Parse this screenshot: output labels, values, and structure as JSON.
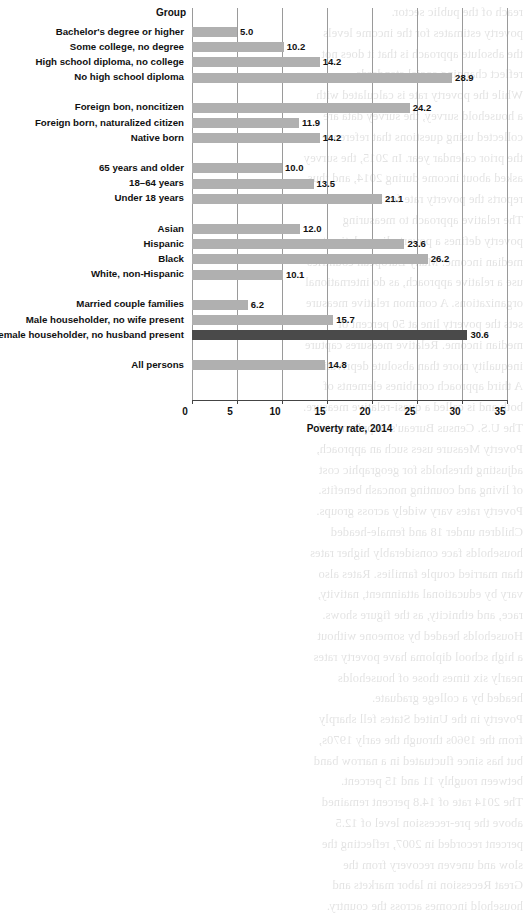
{
  "header": {
    "group_column_label": "Group"
  },
  "axis": {
    "x_title": "Poverty rate, 2014",
    "ticks": [
      "0",
      "5",
      "10",
      "15",
      "20",
      "25",
      "30",
      "35"
    ],
    "xmin": 0,
    "xmax": 35,
    "tick_step": 5
  },
  "colors": {
    "bar": "#b0b0b0",
    "bar_highlight": "#4a4a4a",
    "gridline": "#9a9a9a",
    "axis": "#444444",
    "text": "#111111",
    "background": "#ffffff"
  },
  "chart_data": {
    "type": "bar",
    "orientation": "horizontal",
    "title": "",
    "xlabel": "Poverty rate, 2014",
    "ylabel": "Group",
    "xlim": [
      0,
      35
    ],
    "grid": true,
    "legend": false,
    "categories": [
      "Bachelor's degree or higher",
      "Some college, no degree",
      "High school diploma, no college",
      "No high school diploma",
      "Foreign bon, noncitizen",
      "Foreign born, naturalized citizen",
      "Native born",
      "65 years and older",
      "18–64 years",
      "Under 18 years",
      "Asian",
      "Hispanic",
      "Black",
      "White, non-Hispanic",
      "Married couple families",
      "Male householder, no wife present",
      "Female householder, no husband present",
      "All persons"
    ],
    "values": [
      5.0,
      10.2,
      14.2,
      28.9,
      24.2,
      11.9,
      14.2,
      10.0,
      13.5,
      21.1,
      12.0,
      23.6,
      26.2,
      10.1,
      6.2,
      15.7,
      30.6,
      14.8
    ],
    "value_labels": [
      "5.0",
      "10.2",
      "14.2",
      "28.9",
      "24.2",
      "11.9",
      "14.2",
      "10.0",
      "13.5",
      "21.1",
      "12.0",
      "23.6",
      "26.2",
      "10.1",
      "6.2",
      "15.7",
      "30.6",
      "14.8"
    ],
    "highlighted": [
      false,
      false,
      false,
      false,
      false,
      false,
      false,
      false,
      false,
      false,
      false,
      false,
      false,
      false,
      false,
      false,
      true,
      false
    ],
    "groups": [
      {
        "name": "Educational attainment",
        "indices": [
          0,
          1,
          2,
          3
        ]
      },
      {
        "name": "Nativity",
        "indices": [
          4,
          5,
          6
        ]
      },
      {
        "name": "Age",
        "indices": [
          7,
          8,
          9
        ]
      },
      {
        "name": "Race and ethnicity",
        "indices": [
          10,
          11,
          12,
          13
        ]
      },
      {
        "name": "Family type",
        "indices": [
          14,
          15,
          16
        ]
      },
      {
        "name": "Total",
        "indices": [
          17
        ]
      }
    ]
  },
  "background_bleed": [
    "reach of the public sector.",
    "poverty estimates for the income levels",
    "the absolute approach is that it does not",
    "reflect changing social standards.",
    "While the poverty rate is calculated with",
    "a household survey, the survey data are",
    "collected using questions that reference",
    "the prior calendar year. In 2015, the survey",
    "asked about income during 2014, and thus",
    "reports the poverty rate for 2014.",
    "The relative approach to measuring",
    "poverty defines a poverty line relative to",
    "median income. Many European countries",
    "use a relative approach, as do international",
    "organizations. A common relative measure",
    "sets the poverty line at 50 percent of",
    "median income. Relative measures capture",
    "inequality more than absolute deprivation.",
    "A third approach combines elements of",
    "both and is called a quasi-relative measure.",
    "The U.S. Census Bureau's Supplemental",
    "Poverty Measure uses such an approach,",
    "adjusting thresholds for geographic cost",
    "of living and counting noncash benefits.",
    "Poverty rates vary widely across groups.",
    "Children under 18 and female-headed",
    "households face considerably higher rates",
    "than married couple families. Rates also",
    "vary by educational attainment, nativity,",
    "race, and ethnicity, as the figure shows.",
    "Households headed by someone without",
    "a high school diploma have poverty rates",
    "nearly six times those of households",
    "headed by a college graduate.",
    "Poverty in the United States fell sharply",
    "from the 1960s through the early 1970s,",
    "but has since fluctuated in a narrow band",
    "between roughly 11 and 15 percent.",
    "The 2014 rate of 14.8 percent remained",
    "above the pre-recession level of 12.5",
    "percent recorded in 2007, reflecting the",
    "slow and uneven recovery from the",
    "Great Recession in labor markets and",
    "household incomes across the country."
  ]
}
